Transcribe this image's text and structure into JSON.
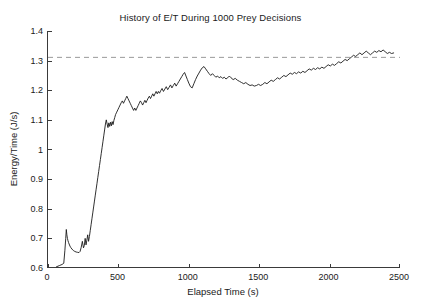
{
  "figure": {
    "width": 421,
    "height": 306,
    "background": "#ffffff",
    "axis_color": "#3a3a3a",
    "line_color": "#1a1a1a",
    "reference_line_color": "#9a9a9a"
  },
  "chart_data": {
    "type": "line",
    "title": "History of E/T During 1000 Prey Decisions",
    "xlabel": "Elapsed Time (s)",
    "ylabel": "Energy/Time (J/s)",
    "xlim": [
      0,
      2500
    ],
    "ylim": [
      0.6,
      1.4
    ],
    "xticks": [
      0,
      500,
      1000,
      1500,
      2000,
      2500
    ],
    "xtick_labels": [
      "0",
      "500",
      "1000",
      "1500",
      "2000",
      "2500"
    ],
    "yticks": [
      0.6,
      0.7,
      0.8,
      0.9,
      1.0,
      1.1,
      1.2,
      1.3,
      1.4
    ],
    "ytick_labels": [
      "0.6",
      "0.7",
      "0.8",
      "0.9",
      "1",
      "1.1",
      "1.2",
      "1.3",
      "1.4"
    ],
    "grid": false,
    "legend": null,
    "annotations": [
      {
        "type": "horizontal-reference-line",
        "label": "asymptotic E/T",
        "y": 1.311,
        "style": "dashed",
        "color": "#9a9a9a"
      }
    ],
    "series": [
      {
        "name": "E/T",
        "style": "solid",
        "color": "#1a1a1a",
        "width": 0.9,
        "x": [
          60,
          80,
          100,
          112,
          120,
          126,
          130,
          134,
          138,
          142,
          146,
          150,
          156,
          162,
          170,
          180,
          190,
          200,
          210,
          220,
          228,
          236,
          244,
          252,
          258,
          264,
          270,
          276,
          282,
          288,
          294,
          300,
          306,
          312,
          318,
          324,
          330,
          336,
          342,
          348,
          354,
          360,
          366,
          372,
          378,
          384,
          390,
          396,
          402,
          408,
          414,
          420,
          426,
          432,
          438,
          444,
          450,
          456,
          462,
          468,
          474,
          480,
          488,
          496,
          504,
          512,
          520,
          528,
          536,
          544,
          552,
          560,
          568,
          576,
          584,
          592,
          600,
          608,
          616,
          624,
          632,
          640,
          648,
          656,
          664,
          672,
          680,
          688,
          696,
          704,
          712,
          720,
          728,
          736,
          744,
          752,
          760,
          768,
          776,
          784,
          792,
          800,
          810,
          820,
          830,
          840,
          850,
          860,
          870,
          880,
          890,
          900,
          910,
          920,
          930,
          940,
          950,
          960,
          970,
          980,
          990,
          1000,
          1012,
          1024,
          1036,
          1048,
          1060,
          1072,
          1084,
          1096,
          1108,
          1120,
          1132,
          1144,
          1156,
          1168,
          1180,
          1192,
          1204,
          1216,
          1228,
          1240,
          1252,
          1264,
          1276,
          1288,
          1300,
          1315,
          1330,
          1345,
          1360,
          1375,
          1390,
          1405,
          1420,
          1435,
          1450,
          1465,
          1480,
          1495,
          1510,
          1525,
          1540,
          1555,
          1570,
          1585,
          1600,
          1615,
          1630,
          1645,
          1660,
          1675,
          1690,
          1705,
          1720,
          1735,
          1750,
          1765,
          1780,
          1795,
          1810,
          1825,
          1840,
          1855,
          1870,
          1885,
          1900,
          1915,
          1930,
          1945,
          1960,
          1975,
          1990,
          2005,
          2020,
          2035,
          2050,
          2065,
          2080,
          2095,
          2110,
          2125,
          2140,
          2155,
          2170,
          2185,
          2200,
          2215,
          2230,
          2245,
          2260,
          2275,
          2290,
          2305,
          2320,
          2335,
          2350,
          2365,
          2380,
          2395,
          2410,
          2425,
          2440,
          2455
        ],
        "y": [
          0.604,
          0.608,
          0.612,
          0.616,
          0.66,
          0.7,
          0.73,
          0.712,
          0.7,
          0.692,
          0.686,
          0.681,
          0.674,
          0.669,
          0.664,
          0.659,
          0.656,
          0.654,
          0.653,
          0.652,
          0.656,
          0.67,
          0.69,
          0.668,
          0.676,
          0.7,
          0.678,
          0.694,
          0.712,
          0.69,
          0.706,
          0.726,
          0.746,
          0.766,
          0.786,
          0.806,
          0.826,
          0.846,
          0.866,
          0.886,
          0.906,
          0.926,
          0.946,
          0.966,
          0.986,
          1.006,
          1.026,
          1.046,
          1.066,
          1.086,
          1.1,
          1.086,
          1.074,
          1.09,
          1.078,
          1.092,
          1.08,
          1.094,
          1.084,
          1.098,
          1.108,
          1.118,
          1.126,
          1.134,
          1.142,
          1.15,
          1.158,
          1.164,
          1.156,
          1.164,
          1.172,
          1.18,
          1.172,
          1.164,
          1.156,
          1.148,
          1.14,
          1.132,
          1.14,
          1.132,
          1.14,
          1.148,
          1.156,
          1.164,
          1.158,
          1.15,
          1.158,
          1.166,
          1.158,
          1.166,
          1.174,
          1.18,
          1.172,
          1.18,
          1.188,
          1.18,
          1.188,
          1.196,
          1.188,
          1.196,
          1.19,
          1.198,
          1.206,
          1.196,
          1.204,
          1.212,
          1.202,
          1.21,
          1.218,
          1.208,
          1.216,
          1.224,
          1.214,
          1.222,
          1.23,
          1.238,
          1.246,
          1.254,
          1.26,
          1.248,
          1.236,
          1.224,
          1.212,
          1.208,
          1.222,
          1.236,
          1.248,
          1.258,
          1.268,
          1.276,
          1.28,
          1.272,
          1.264,
          1.256,
          1.25,
          1.256,
          1.25,
          1.244,
          1.248,
          1.242,
          1.246,
          1.24,
          1.244,
          1.238,
          1.242,
          1.248,
          1.242,
          1.236,
          1.24,
          1.234,
          1.23,
          1.226,
          1.222,
          1.226,
          1.22,
          1.216,
          1.218,
          1.214,
          1.216,
          1.22,
          1.216,
          1.22,
          1.226,
          1.222,
          1.228,
          1.234,
          1.23,
          1.236,
          1.242,
          1.238,
          1.244,
          1.25,
          1.246,
          1.252,
          1.258,
          1.254,
          1.26,
          1.256,
          1.262,
          1.258,
          1.264,
          1.26,
          1.266,
          1.272,
          1.268,
          1.274,
          1.27,
          1.276,
          1.272,
          1.278,
          1.274,
          1.28,
          1.286,
          1.282,
          1.288,
          1.284,
          1.29,
          1.296,
          1.292,
          1.298,
          1.304,
          1.3,
          1.306,
          1.312,
          1.318,
          1.314,
          1.32,
          1.326,
          1.32,
          1.326,
          1.332,
          1.326,
          1.32,
          1.326,
          1.332,
          1.328,
          1.334,
          1.33,
          1.336,
          1.33,
          1.324,
          1.328,
          1.324,
          1.326
        ]
      }
    ]
  }
}
